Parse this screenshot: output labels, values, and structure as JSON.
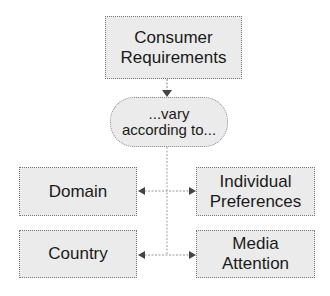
{
  "diagram": {
    "top": {
      "label": "Consumer\nRequirements"
    },
    "middle": {
      "label": "...vary\naccording to..."
    },
    "factors": [
      {
        "label": "Domain"
      },
      {
        "label": "Individual\nPreferences"
      },
      {
        "label": "Country"
      },
      {
        "label": "Media\nAttention"
      }
    ]
  },
  "colors": {
    "box_fill": "#ebebeb",
    "box_border": "#7a7a7a",
    "connector": "#9a9a9a",
    "arrowhead": "#444444"
  }
}
